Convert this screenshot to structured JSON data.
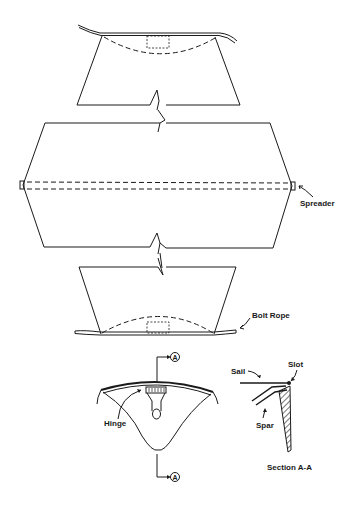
{
  "diagram": {
    "labels": {
      "spreader": "Spreader",
      "bolt_rope": "Bolt Rope",
      "hinge": "Hinge",
      "sail": "Sail",
      "slot": "Slot",
      "spar": "Spar",
      "section": "Section A-A",
      "section_marker_top": "A",
      "section_marker_bottom": "A"
    },
    "colors": {
      "line": "#1a1a1a",
      "background": "#ffffff"
    }
  }
}
